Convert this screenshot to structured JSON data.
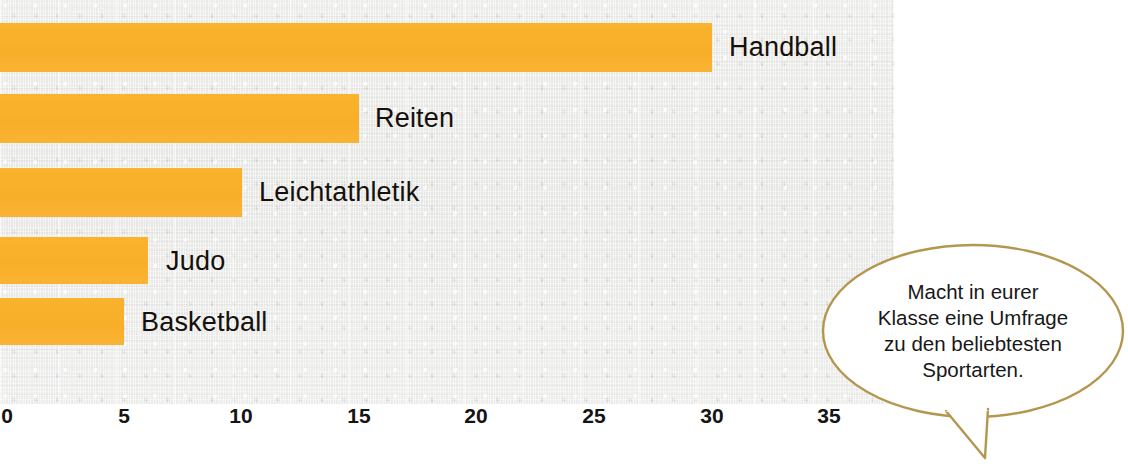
{
  "chart_data": {
    "type": "bar",
    "orientation": "horizontal",
    "title": "",
    "xlabel": "",
    "ylabel": "",
    "categories": [
      "Handball",
      "Reiten",
      "Leichtathletik",
      "Judo",
      "Basketball"
    ],
    "values": [
      30,
      15,
      10,
      6,
      5
    ],
    "xlim": [
      0,
      37
    ],
    "xticks": [
      0,
      5,
      10,
      15,
      20,
      25,
      30,
      35
    ],
    "xtick_labels": [
      "0",
      "5",
      "10",
      "15",
      "20",
      "25",
      "30",
      "35"
    ],
    "grid": false,
    "legend": null,
    "bar_color": "#f9b233",
    "background_color": "#e9e9e6",
    "annotations": [
      {
        "type": "speech-bubble",
        "lines": [
          "Macht in eurer",
          "Klasse eine Umfrage",
          "zu den beliebtesten",
          "Sportarten."
        ],
        "outline_color": "#b4944a"
      }
    ]
  },
  "bars": [
    {
      "label": "Handball",
      "value": 30,
      "label_x": 729,
      "top": 23,
      "height": 49
    },
    {
      "label": "Reiten",
      "value": 15,
      "label_x": 375,
      "top": 94,
      "height": 49
    },
    {
      "label": "Leichtathletik",
      "value": 10,
      "label_x": 259,
      "top": 168,
      "height": 49
    },
    {
      "label": "Judo",
      "value": 6,
      "label_x": 166,
      "top": 237,
      "height": 47
    },
    {
      "label": "Basketball",
      "value": 5,
      "label_x": 141,
      "top": 298,
      "height": 47
    }
  ],
  "axis": {
    "ticks": [
      {
        "label": "0",
        "x": 7
      },
      {
        "label": "5",
        "x": 124
      },
      {
        "label": "10",
        "x": 241
      },
      {
        "label": "15",
        "x": 359
      },
      {
        "label": "20",
        "x": 476
      },
      {
        "label": "25",
        "x": 594
      },
      {
        "label": "30",
        "x": 712
      },
      {
        "label": "35",
        "x": 829
      }
    ]
  },
  "speech_bubble": {
    "line1": "Macht in eurer",
    "line2": "Klasse eine Umfrage",
    "line3": "zu den beliebtesten",
    "line4": "Sportarten."
  }
}
